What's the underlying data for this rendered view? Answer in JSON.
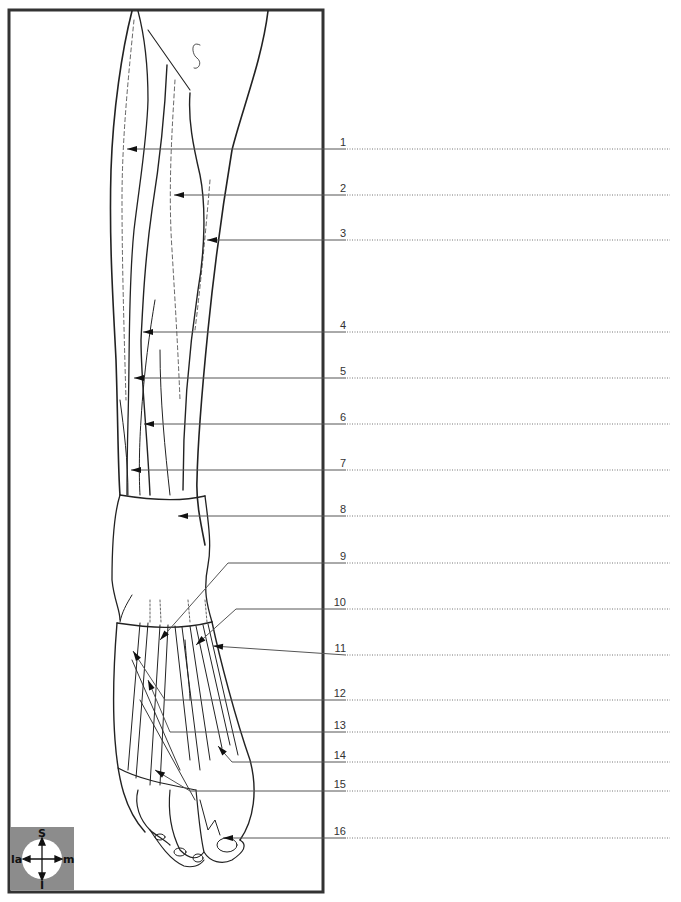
{
  "diagram": {
    "frame": {
      "border_color": "#333333"
    },
    "compass": {
      "superior": "S",
      "inferior": "I",
      "lateral": "la",
      "medial": "m",
      "box_color": "#8c8c8c"
    },
    "labels": [
      {
        "num": "1",
        "y": 149,
        "tip_x": 127,
        "tip_y": 149
      },
      {
        "num": "2",
        "y": 195,
        "tip_x": 174,
        "tip_y": 195
      },
      {
        "num": "3",
        "y": 240,
        "tip_x": 207,
        "tip_y": 240
      },
      {
        "num": "4",
        "y": 332,
        "tip_x": 143,
        "tip_y": 332
      },
      {
        "num": "5",
        "y": 378,
        "tip_x": 134,
        "tip_y": 378
      },
      {
        "num": "6",
        "y": 424,
        "tip_x": 144,
        "tip_y": 424
      },
      {
        "num": "7",
        "y": 470,
        "tip_x": 131,
        "tip_y": 470
      },
      {
        "num": "8",
        "y": 516,
        "tip_x": 178,
        "tip_y": 516
      },
      {
        "num": "9",
        "y": 563,
        "tip_x": 160,
        "tip_y": 640
      },
      {
        "num": "10",
        "y": 609,
        "tip_x": 196,
        "tip_y": 645
      },
      {
        "num": "11",
        "y": 655,
        "tip_x": 213,
        "tip_y": 646
      },
      {
        "num": "12",
        "y": 700,
        "tip_x": 133,
        "tip_y": 651
      },
      {
        "num": "13",
        "y": 732,
        "tip_x": 148,
        "tip_y": 680
      },
      {
        "num": "14",
        "y": 762,
        "tip_x": 218,
        "tip_y": 746
      },
      {
        "num": "15",
        "y": 791,
        "tip_x": 155,
        "tip_y": 770
      },
      {
        "num": "16",
        "y": 838,
        "tip_x": 223,
        "tip_y": 838
      }
    ],
    "answer_lines": {
      "count": 16,
      "style": "dotted"
    }
  }
}
